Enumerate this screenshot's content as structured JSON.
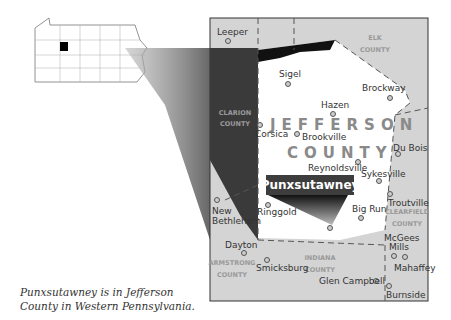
{
  "map": {
    "county_title_line1": "JEFFERSON",
    "county_title_line2": "COUNTY",
    "highlight_town": "Punxsutawney",
    "neighbors": [
      {
        "line1": "ELK",
        "line2": "COUNTY"
      },
      {
        "line1": "CLARION",
        "line2": "COUNTY"
      },
      {
        "line1": "CLEARFIELD",
        "line2": "COUNTY"
      },
      {
        "line1": "INDIANA",
        "line2": "COUNTY"
      },
      {
        "line1": "ARMSTRONG",
        "line2": "COUNTY"
      }
    ],
    "towns": [
      "Leeper",
      "Sigel",
      "Brockway",
      "Hazen",
      "Corsica",
      "Brookville",
      "Du Bois",
      "Reynoldsville",
      "Sykesville",
      "Troutville",
      "New",
      "Bethlehem",
      "Ringgold",
      "Big Run",
      "Dayton",
      "McGees",
      "Mills",
      "Mahaffey",
      "Smicksburg",
      "Glen Campbell",
      "Burnside"
    ]
  },
  "caption": {
    "line1": "Punxsutawney is in Jefferson",
    "line2": "County in Western Pennsylvania."
  }
}
